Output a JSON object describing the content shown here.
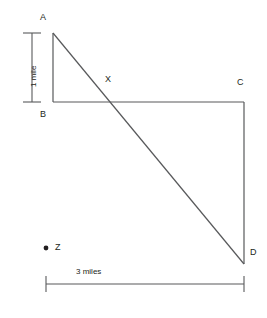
{
  "figure": {
    "type": "geometry-diagram",
    "clipped_header_text": "",
    "stroke_color": "#58595b",
    "label_color": "#231f20",
    "background_color": "#ffffff",
    "points": [
      {
        "name": "A",
        "label": "A",
        "x": 53,
        "y": 33,
        "label_x": 40,
        "label_y": 13
      },
      {
        "name": "B",
        "label": "B",
        "x": 53,
        "y": 102,
        "label_x": 40,
        "label_y": 110
      },
      {
        "name": "C",
        "label": "C",
        "x": 244,
        "y": 102,
        "label_x": 237,
        "label_y": 78
      },
      {
        "name": "D",
        "label": "D",
        "x": 244,
        "y": 264,
        "label_x": 250,
        "label_y": 248
      },
      {
        "name": "X",
        "label": "X",
        "x": 110,
        "y": 102,
        "label_x": 105,
        "label_y": 75
      },
      {
        "name": "Z",
        "label": "Z",
        "x": 46,
        "y": 248,
        "label_x": 55,
        "label_y": 243
      }
    ],
    "segments": [
      {
        "name": "segment-AB",
        "from": "A",
        "to": "B"
      },
      {
        "name": "segment-BC",
        "from": "B",
        "to": "C"
      },
      {
        "name": "segment-CD",
        "from": "C",
        "to": "D"
      },
      {
        "name": "segment-AD-diagonal",
        "from": "A",
        "to": "D"
      }
    ],
    "dimensions": [
      {
        "name": "vertical-dimension",
        "label": "1 mile",
        "orientation": "vertical",
        "x": 32,
        "y_start": 33,
        "y_end": 102,
        "cap_half_width": 9,
        "label_x": 30,
        "label_y": 87
      },
      {
        "name": "horizontal-dimension",
        "label": "3 miles",
        "orientation": "horizontal",
        "y": 284,
        "x_start": 46,
        "x_end": 244,
        "cap_half_height": 8,
        "label_x": 76,
        "label_y": 268
      }
    ]
  }
}
